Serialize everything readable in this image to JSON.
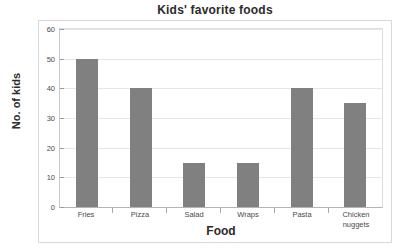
{
  "chart_data": {
    "type": "bar",
    "title": "Kids' favorite foods",
    "xlabel": "Food",
    "ylabel": "No. of kids",
    "categories": [
      "Fries",
      "Pizza",
      "Salad",
      "Wraps",
      "Pasta",
      "Chicken nuggets"
    ],
    "category_lines": [
      [
        "Fries"
      ],
      [
        "Pizza"
      ],
      [
        "Salad"
      ],
      [
        "Wraps"
      ],
      [
        "Pasta"
      ],
      [
        "Chicken",
        "nuggets"
      ]
    ],
    "values": [
      50,
      40,
      15,
      15,
      40,
      35
    ],
    "ylim": [
      0,
      60
    ],
    "yticks": [
      0,
      10,
      20,
      30,
      40,
      50,
      60
    ],
    "ytick_labels": [
      "0",
      "10",
      "20",
      "30",
      "40",
      "50",
      "60"
    ],
    "grid": true,
    "legend": false,
    "bar_color": "#808080",
    "gridline_color": "#e6e6e6",
    "background_color": "#ffffff",
    "text_color": "#2b2b2b"
  }
}
